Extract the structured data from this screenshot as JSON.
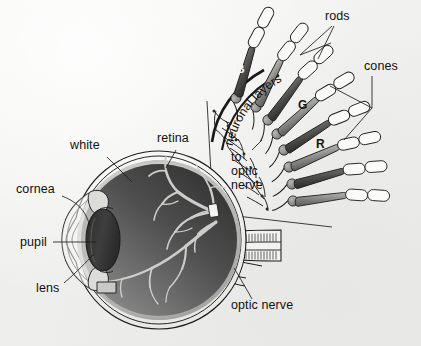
{
  "figure": {
    "background_color": "#efefed",
    "ink_color": "#111111"
  },
  "eye_labels": [
    {
      "name": "white",
      "text": "white",
      "x": 70,
      "y": 144
    },
    {
      "name": "retina",
      "text": "retina",
      "x": 157,
      "y": 137
    },
    {
      "name": "cornea",
      "text": "cornea",
      "x": 18,
      "y": 189
    },
    {
      "name": "pupil",
      "text": "pupil",
      "x": 23,
      "y": 241
    },
    {
      "name": "lens",
      "text": "lens",
      "x": 39,
      "y": 288
    },
    {
      "name": "optic-nerve",
      "text": "optic nerve",
      "x": 232,
      "y": 304
    }
  ],
  "inset_labels": [
    {
      "name": "rods",
      "text": "rods",
      "x": 327,
      "y": 15
    },
    {
      "name": "cones",
      "text": "cones",
      "x": 366,
      "y": 65
    }
  ],
  "inset_curved_label": {
    "name": "neuronal-layers",
    "text": "neuronal layers"
  },
  "inset_stack_label": {
    "name": "to-optic-nerve",
    "lines": [
      "to",
      "optic",
      "nerve"
    ],
    "x": 232,
    "y": 156
  },
  "photoreceptor_letters": [
    {
      "name": "cone-letter-blue",
      "text": "B",
      "x": 238,
      "y": 68,
      "style": "bright"
    },
    {
      "name": "cone-letter-green",
      "text": "G",
      "x": 300,
      "y": 104,
      "style": "dark"
    },
    {
      "name": "cone-letter-red",
      "text": "R",
      "x": 318,
      "y": 143,
      "style": "dark"
    }
  ],
  "colors": {
    "interior_dark": "#3b3b3b",
    "interior_mid": "#6e6e6e",
    "interior_light": "#9a9a9a",
    "vessel": "#cbcbc8",
    "lens_dark": "#3a3a3a",
    "cone_body": "#8d8d8a",
    "cone_shadow": "#5c5c5a",
    "rod_fill": "#fbfbf9",
    "nucleus": "#8a8a87"
  },
  "counts": {
    "cones_drawn": 8,
    "rods_drawn": 9
  }
}
